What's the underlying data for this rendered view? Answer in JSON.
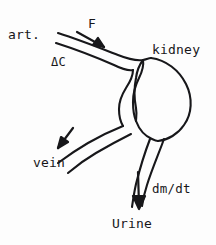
{
  "figure": {
    "background_color": "#fdfdfd",
    "ink_color": "#17171a",
    "labels": {
      "artery": "art.",
      "flow": "F",
      "delta_c": "ΔC",
      "kidney": "kidney",
      "vein": "vein",
      "mass_rate": "dm/dt",
      "urine": "Urine"
    },
    "arrows": [
      {
        "name": "flow-arrow",
        "label": "F",
        "direction": "down-right"
      },
      {
        "name": "vein-arrow",
        "label": "vein",
        "direction": "down-left"
      },
      {
        "name": "urine-arrow",
        "label": "dm/dt",
        "direction": "down"
      }
    ],
    "parts": [
      {
        "name": "artery-vessel",
        "label": "art."
      },
      {
        "name": "kidney-body",
        "label": "kidney"
      },
      {
        "name": "vein-vessel",
        "label": "vein"
      },
      {
        "name": "ureter-outlet",
        "label": "Urine"
      }
    ]
  }
}
